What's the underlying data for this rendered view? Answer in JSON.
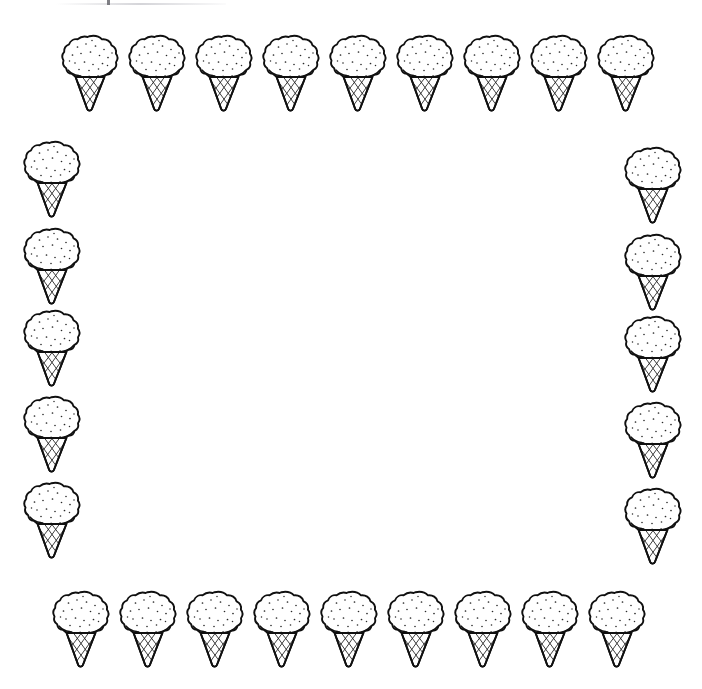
{
  "page": {
    "background_color": "#ffffff",
    "ink_color": "#101010",
    "width": 702,
    "height": 689
  },
  "artifact": {
    "name": "scan-edge-smudge",
    "present": true
  },
  "center": {
    "name": "blank-writing-area",
    "content": ""
  },
  "border": {
    "total_cones": 28,
    "icon_name": "ice-cream-cone-icon",
    "rows": {
      "top": {
        "count": 9,
        "y": 33,
        "x_positions": [
          62,
          129,
          196,
          263,
          330,
          397,
          464,
          531,
          598
        ]
      },
      "bottom": {
        "count": 9,
        "y": 589,
        "x_positions": [
          53,
          120,
          187,
          254,
          321,
          388,
          455,
          522,
          589
        ]
      },
      "left": {
        "count": 5,
        "x": 24,
        "y_positions": [
          139,
          226,
          308,
          394,
          480
        ]
      },
      "right": {
        "count": 5,
        "x": 625,
        "y_positions": [
          145,
          232,
          314,
          400,
          486
        ]
      }
    }
  }
}
